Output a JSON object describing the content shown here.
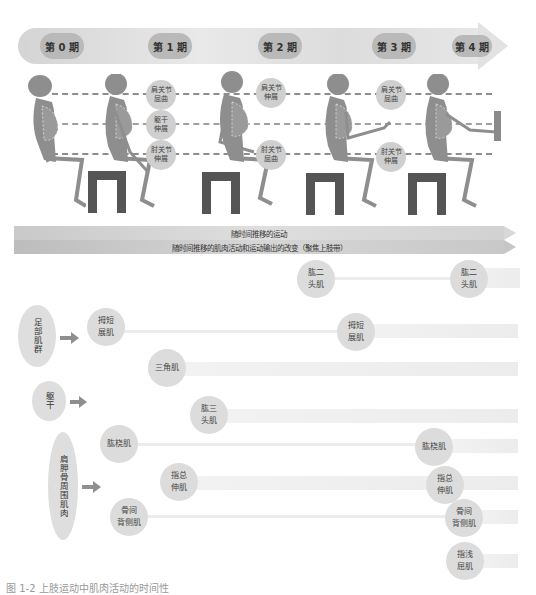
{
  "timeline": {
    "phases": [
      {
        "label": "第 0 期",
        "x": 40,
        "w": 44
      },
      {
        "label": "第 1 期",
        "x": 148,
        "w": 44
      },
      {
        "label": "第 2 期",
        "x": 258,
        "w": 44
      },
      {
        "label": "第 3 期",
        "x": 372,
        "w": 44
      },
      {
        "label": "第 4 期",
        "x": 452,
        "w": 40
      }
    ]
  },
  "skeleton_section": {
    "joint_labels": [
      {
        "id": "p1-shoulder",
        "text": "肩关节\n屈曲",
        "x": 146,
        "y": 84
      },
      {
        "id": "p1-trunk",
        "text": "躯干\n伸展",
        "x": 146,
        "y": 114
      },
      {
        "id": "p1-elbow",
        "text": "肘关节\n伸展",
        "x": 146,
        "y": 144
      },
      {
        "id": "p2-shoulder",
        "text": "肩关节\n伸展",
        "x": 256,
        "y": 81
      },
      {
        "id": "p2-elbow",
        "text": "肘关节\n屈曲",
        "x": 256,
        "y": 144
      },
      {
        "id": "p3-shoulder",
        "text": "肩关节\n屈曲",
        "x": 376,
        "y": 83
      },
      {
        "id": "p3-elbow",
        "text": "肘关节\n伸展",
        "x": 376,
        "y": 144
      }
    ]
  },
  "bands": {
    "movement": "随时间推移的运动",
    "muscle_change": "随时间推移的肌肉活动和运动输出的改变（聚焦上肢带）"
  },
  "muscle_groups": [
    {
      "id": "foot",
      "label": "足部肌群",
      "x": 18,
      "y": 305,
      "w": 38,
      "h": 62
    },
    {
      "id": "trunk",
      "label": "躯干",
      "x": 32,
      "y": 381,
      "w": 34,
      "h": 40
    },
    {
      "id": "scapula",
      "label": "肩胛骨周围肌肉",
      "x": 48,
      "y": 432,
      "w": 30,
      "h": 108
    }
  ],
  "muscles": [
    {
      "id": "biceps-start",
      "label": "肱二\n头肌",
      "x": 297,
      "y": 260
    },
    {
      "id": "biceps-end",
      "label": "肱二\n头肌",
      "x": 450,
      "y": 260
    },
    {
      "id": "apl-start",
      "label": "拇短\n展肌",
      "x": 87,
      "y": 308
    },
    {
      "id": "apl-end",
      "label": "拇短\n展肌",
      "x": 337,
      "y": 313
    },
    {
      "id": "deltoid",
      "label": "三角肌",
      "x": 148,
      "y": 349
    },
    {
      "id": "triceps",
      "label": "肱三\n头肌",
      "x": 190,
      "y": 396
    },
    {
      "id": "brachioradialis-start",
      "label": "肱桡肌",
      "x": 100,
      "y": 425
    },
    {
      "id": "brachioradialis-end",
      "label": "肱桡肌",
      "x": 415,
      "y": 428
    },
    {
      "id": "edc-start",
      "label": "指总\n伸肌",
      "x": 160,
      "y": 463
    },
    {
      "id": "edc-end",
      "label": "指总\n伸肌",
      "x": 426,
      "y": 466
    },
    {
      "id": "dorsal-interossei-start",
      "label": "骨间\n背侧肌",
      "x": 110,
      "y": 498
    },
    {
      "id": "dorsal-interossei-end",
      "label": "骨间\n背侧肌",
      "x": 445,
      "y": 499
    },
    {
      "id": "fds",
      "label": "指浅\n屈肌",
      "x": 446,
      "y": 542
    }
  ],
  "caption": "图 1-2 上肢运动中肌肉活动的时间性"
}
